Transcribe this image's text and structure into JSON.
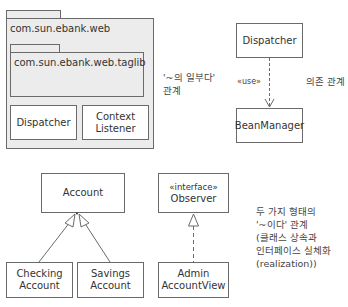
{
  "composition": {
    "outer_package": {
      "name": "com.sun.ebank.web"
    },
    "inner_package": {
      "name": "com.sun.ebank.web.taglib"
    },
    "classes": [
      {
        "name": "Dispatcher"
      },
      {
        "name": "Context\nListener",
        "line1": "Context",
        "line2": "Listener"
      }
    ],
    "note": {
      "line1": "'~의 일부다'",
      "line2": "관계"
    }
  },
  "dependency": {
    "source": "Dispatcher",
    "target": "BeanManager",
    "stereotype": "«use»",
    "note": "의존 관계"
  },
  "inheritance": {
    "parent": "Account",
    "children": [
      {
        "line1": "Checking",
        "line2": "Account"
      },
      {
        "line1": "Savings",
        "line2": "Account"
      }
    ]
  },
  "realization": {
    "interface_stereotype": "«interface»",
    "interface_name": "Observer",
    "implementer": {
      "line1": "Admin",
      "line2": "AccountView"
    }
  },
  "is_a_note": {
    "lines": [
      "두 가지 형태의",
      "'~이다' 관계",
      "(클래스 상속과",
      "인터페이스 실체화",
      "(realization))"
    ]
  },
  "colors": {
    "line": "#6a6a6a",
    "package_fill": "#ececec",
    "class_fill": "#ffffff",
    "text": "#333333"
  }
}
